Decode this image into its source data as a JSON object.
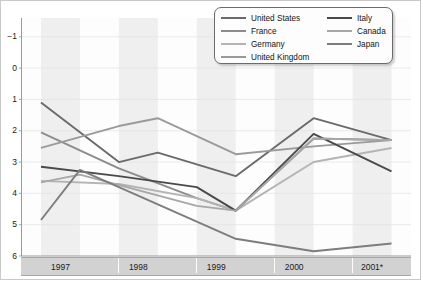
{
  "chart_data": {
    "type": "line",
    "title": "",
    "subtitle": "",
    "xlabel": "",
    "ylabel": "",
    "grid": true,
    "legend_position": "top-right",
    "xlim": [
      1996.75,
      2001.75
    ],
    "ylim": [
      -1,
      6.6
    ],
    "yticks": [
      -1,
      0,
      1,
      2,
      3,
      4,
      5,
      6
    ],
    "ytick_labels": [
      "−1",
      "0",
      "1",
      "2",
      "3",
      "4",
      "5",
      "6"
    ],
    "xtick_labels": [
      "1997",
      "1998",
      "1999",
      "2000",
      "2001*"
    ],
    "x": [
      1997.0,
      1997.5,
      1998.0,
      1998.5,
      1999.0,
      1999.5,
      2000.0,
      2000.5,
      2001.0,
      2001.5
    ],
    "series": [
      {
        "name": "United States",
        "color": "#6a6a6a",
        "x": [
          1997.0,
          1998.0,
          1998.5,
          1999.5,
          2000.5,
          2001.5
        ],
        "values": [
          3.9,
          2.0,
          2.3,
          1.55,
          3.4,
          2.7
        ]
      },
      {
        "name": "France",
        "color": "#8c8c8c",
        "x": [
          1997.0,
          1998.0,
          1999.0,
          1999.5,
          2000.5,
          2001.5
        ],
        "values": [
          2.95,
          1.8,
          0.85,
          0.45,
          2.75,
          2.7
        ]
      },
      {
        "name": "Germany",
        "color": "#b4b4b4",
        "x": [
          1997.0,
          1998.0,
          1999.0,
          1999.5,
          2000.5,
          2001.5
        ],
        "values": [
          1.4,
          1.3,
          0.85,
          0.45,
          2.0,
          2.45
        ]
      },
      {
        "name": "United Kingdom",
        "color": "#9a9a9a",
        "x": [
          1997.0,
          1998.0,
          1998.5,
          1999.5,
          2000.5,
          2001.5
        ],
        "values": [
          2.45,
          3.15,
          3.4,
          2.25,
          2.5,
          2.7
        ]
      },
      {
        "name": "Italy",
        "color": "#4a4a4a",
        "x": [
          1997.0,
          1998.0,
          1999.0,
          1999.5,
          2000.5,
          2001.5
        ],
        "values": [
          1.85,
          1.55,
          1.2,
          0.45,
          2.9,
          1.7
        ]
      },
      {
        "name": "Canada",
        "color": "#a7a7a7",
        "x": [
          1997.0,
          1997.5,
          1999.0,
          1999.5,
          2000.5,
          2001.5
        ],
        "values": [
          1.35,
          1.6,
          0.6,
          0.45,
          2.75,
          2.7
        ]
      },
      {
        "name": "Japan",
        "color": "#7d7d7d",
        "x": [
          1997.0,
          1997.5,
          1999.5,
          2000.5,
          2001.5
        ],
        "values": [
          0.15,
          1.75,
          -0.45,
          -0.85,
          -0.6
        ]
      }
    ]
  },
  "legend": {
    "entries": [
      {
        "label": "United States",
        "color": "#6a6a6a"
      },
      {
        "label": "France",
        "color": "#8c8c8c"
      },
      {
        "label": "Germany",
        "color": "#b4b4b4"
      },
      {
        "label": "United Kingdom",
        "color": "#9a9a9a"
      },
      {
        "label": "Italy",
        "color": "#4a4a4a"
      },
      {
        "label": "Canada",
        "color": "#a7a7a7"
      },
      {
        "label": "Japan",
        "color": "#7d7d7d"
      }
    ]
  },
  "axes": {
    "y_labels": [
      "6",
      "5",
      "4",
      "3",
      "2",
      "1",
      "0",
      "−1"
    ],
    "x_labels": [
      "1997",
      "1998",
      "1999",
      "2000",
      "2001*"
    ]
  },
  "colors": {
    "band": "#efefef",
    "plot_bg": "#fdfdfd",
    "axis_line": "#9a9a9a",
    "xaxis_band": "#d2d2d2"
  }
}
